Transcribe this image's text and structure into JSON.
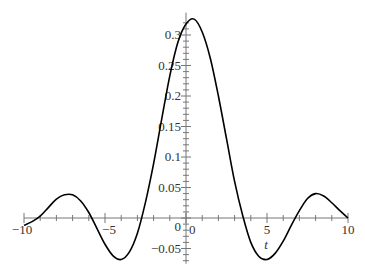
{
  "chart_data": {
    "type": "line",
    "title": "",
    "xlabel": "t",
    "ylabel": "",
    "xlim": [
      -10,
      10
    ],
    "ylim": [
      -0.075,
      0.33
    ],
    "grid": false,
    "legend": null,
    "x_ticks": [
      -10,
      -5,
      0,
      5,
      10
    ],
    "x_tick_labels": [
      "-10",
      "-5",
      "0",
      "5",
      "10"
    ],
    "y_ticks": [
      -0.05,
      0,
      0.05,
      0.1,
      0.15,
      0.2,
      0.25,
      0.3
    ],
    "y_tick_labels": [
      "-0.05",
      "0",
      "0.05",
      "0.1",
      "0.15",
      "0.2",
      "0.25",
      "0.3"
    ],
    "series": [
      {
        "name": "f(t)",
        "color": "#000000",
        "x": [
          -10,
          -9.5,
          -9,
          -8.5,
          -8,
          -7.5,
          -7,
          -6.5,
          -6,
          -5.5,
          -5,
          -4.5,
          -4,
          -3.5,
          -3,
          -2.5,
          -2,
          -1.5,
          -1,
          -0.5,
          0,
          0.5,
          1,
          1.5,
          2,
          2.5,
          3,
          3.5,
          4,
          4.5,
          5,
          5.5,
          6,
          6.5,
          7,
          7.5,
          8,
          8.5,
          9,
          9.5,
          10
        ],
        "values": [
          -0.012,
          -0.006,
          0.003,
          0.017,
          0.031,
          0.038,
          0.038,
          0.028,
          0.009,
          -0.017,
          -0.043,
          -0.062,
          -0.068,
          -0.056,
          -0.025,
          0.026,
          0.089,
          0.162,
          0.233,
          0.288,
          0.318,
          0.326,
          0.305,
          0.262,
          0.2,
          0.13,
          0.06,
          0.004,
          -0.04,
          -0.063,
          -0.068,
          -0.058,
          -0.038,
          -0.012,
          0.012,
          0.032,
          0.04,
          0.036,
          0.025,
          0.012,
          0.0
        ]
      }
    ]
  }
}
